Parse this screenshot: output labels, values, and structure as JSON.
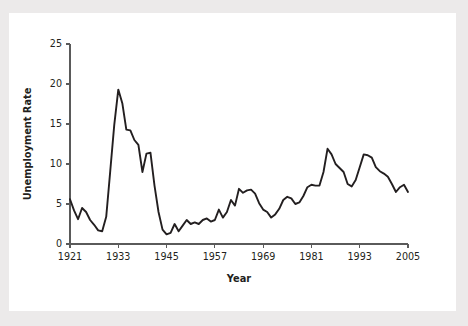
{
  "figure": {
    "background_color": "#ffffff",
    "outer_background_color": "#eceaea",
    "line_color": "#231f20",
    "axis_color": "#5a5a5a"
  },
  "chart_data": {
    "type": "line",
    "title": "",
    "xlabel": "Year",
    "ylabel": "Unemployment Rate",
    "xlim": [
      1921,
      2005
    ],
    "ylim": [
      0,
      25
    ],
    "xticks": [
      1921,
      1933,
      1945,
      1957,
      1969,
      1981,
      1993,
      2005
    ],
    "xtick_labels": [
      "1921",
      "1933",
      "1945",
      "1957",
      "1969",
      "1981",
      "1993",
      "2005"
    ],
    "yticks": [
      0,
      5,
      10,
      15,
      20,
      25
    ],
    "ytick_labels": [
      "0",
      "5",
      "10",
      "15",
      "20",
      "25"
    ],
    "grid": false,
    "legend": false,
    "legend_position": "none",
    "series": [
      {
        "name": "Unemployment Rate",
        "x": [
          1921,
          1922,
          1923,
          1924,
          1925,
          1926,
          1927,
          1928,
          1929,
          1930,
          1931,
          1932,
          1933,
          1934,
          1935,
          1936,
          1937,
          1938,
          1939,
          1940,
          1941,
          1942,
          1943,
          1944,
          1945,
          1946,
          1947,
          1948,
          1949,
          1950,
          1951,
          1952,
          1953,
          1954,
          1955,
          1956,
          1957,
          1958,
          1959,
          1960,
          1961,
          1962,
          1963,
          1964,
          1965,
          1966,
          1967,
          1968,
          1969,
          1970,
          1971,
          1972,
          1973,
          1974,
          1975,
          1976,
          1977,
          1978,
          1979,
          1980,
          1981,
          1982,
          1983,
          1984,
          1985,
          1986,
          1987,
          1988,
          1989,
          1990,
          1991,
          1992,
          1993,
          1994,
          1995,
          1996,
          1997,
          1998,
          1999,
          2000,
          2001,
          2002,
          2003,
          2004,
          2005
        ],
        "y": [
          5.6,
          4.2,
          3.1,
          4.5,
          4.0,
          3.0,
          2.4,
          1.7,
          1.6,
          3.4,
          9.1,
          14.9,
          19.3,
          17.6,
          14.3,
          14.2,
          13.0,
          12.4,
          9.0,
          11.3,
          11.4,
          7.3,
          4.0,
          1.8,
          1.2,
          1.4,
          2.5,
          1.6,
          2.3,
          3.0,
          2.5,
          2.7,
          2.5,
          3.0,
          3.2,
          2.8,
          3.0,
          4.3,
          3.3,
          4.0,
          5.5,
          4.8,
          6.9,
          6.4,
          6.7,
          6.8,
          6.3,
          5.1,
          4.3,
          4.0,
          3.3,
          3.7,
          4.4,
          5.5,
          5.9,
          5.7,
          5.0,
          5.2,
          6.0,
          7.1,
          7.4,
          7.3,
          7.3,
          9.0,
          11.9,
          11.2,
          10.0,
          9.5,
          9.0,
          7.5,
          7.2,
          8.0,
          9.6,
          11.2,
          11.1,
          10.8,
          9.6,
          9.1,
          8.8,
          8.4,
          7.5,
          6.5,
          7.1,
          7.4,
          6.5
        ]
      }
    ]
  },
  "labels": {
    "y_axis_title": "Unemployment Rate",
    "x_axis_title": "Year"
  }
}
